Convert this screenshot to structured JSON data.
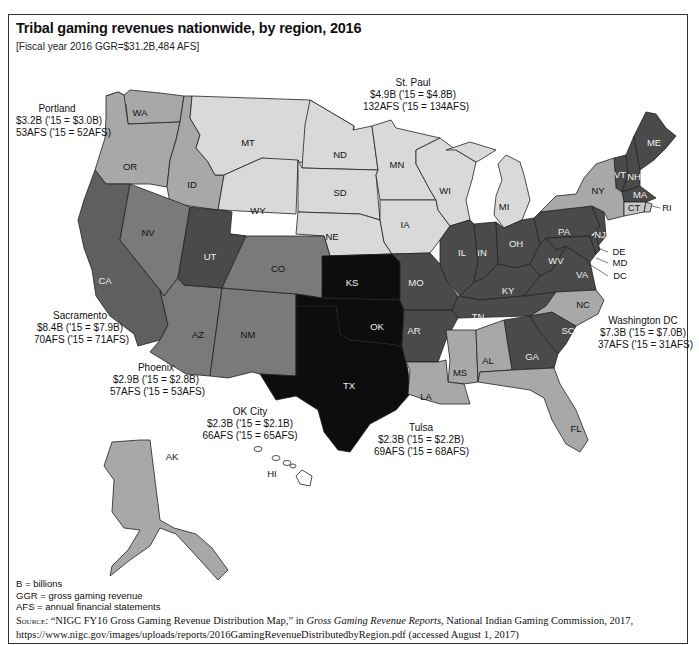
{
  "figure": {
    "title": "Tribal gaming revenues nationwide, by region, 2016",
    "subtitle": "[Fiscal year 2016 GGR=$31.2B,484 AFS]"
  },
  "colors": {
    "darkest": "#0d0d0d",
    "dark": "#4a4a4a",
    "medium_dark": "#5f5f5f",
    "medium": "#7a7a7a",
    "medium_light": "#a8a8a8",
    "light": "#d9d9d9",
    "border": "#222222"
  },
  "regions": {
    "portland": {
      "name": "Portland",
      "ggr": "$3.2B ('15 = $3.0B)",
      "afs": "53AFS ('15 = 52AFS)"
    },
    "st_paul": {
      "name": "St. Paul",
      "ggr": "$4.9B ('15 = $4.8B)",
      "afs": "132AFS ('15 = 134AFS)"
    },
    "sacramento": {
      "name": "Sacramento",
      "ggr": "$8.4B ('15 = $7.9B)",
      "afs": "70AFS ('15 = 71AFS)"
    },
    "phoenix": {
      "name": "Phoenix",
      "ggr": "$2.9B ('15 = $2.8B)",
      "afs": "57AFS ('15 = 53AFS)"
    },
    "ok_city": {
      "name": "OK City",
      "ggr": "$2.3B ('15 = $2.1B)",
      "afs": "66AFS ('15 = 65AFS)"
    },
    "tulsa": {
      "name": "Tulsa",
      "ggr": "$2.3B ('15 = $2.2B)",
      "afs": "69AFS ('15 = 68AFS)"
    },
    "washington_dc": {
      "name": "Washington DC",
      "ggr": "$7.3B ('15 = $7.0B)",
      "afs": "37AFS ('15 = 31AFS)"
    }
  },
  "states": {
    "WA": "WA",
    "OR": "OR",
    "ID": "ID",
    "MT": "MT",
    "WY": "WY",
    "ND": "ND",
    "SD": "SD",
    "NE": "NE",
    "MN": "MN",
    "IA": "IA",
    "WI": "WI",
    "MI": "MI",
    "CA": "CA",
    "NV": "NV",
    "UT": "UT",
    "CO": "CO",
    "AZ": "AZ",
    "NM": "NM",
    "KS": "KS",
    "OK": "OK",
    "TX": "TX",
    "MO": "MO",
    "AR": "AR",
    "LA": "LA",
    "MS": "MS",
    "AL": "AL",
    "FL": "FL",
    "GA": "GA",
    "SC": "SC",
    "NC": "NC",
    "TN": "TN",
    "KY": "KY",
    "IL": "IL",
    "IN": "IN",
    "OH": "OH",
    "WV": "WV",
    "VA": "VA",
    "PA": "PA",
    "NY": "NY",
    "NJ": "NJ",
    "DE": "DE",
    "MD": "MD",
    "DC": "DC",
    "VT": "VT",
    "NH": "NH",
    "ME": "ME",
    "MA": "MA",
    "CT": "CT",
    "RI": "RI",
    "AK": "AK",
    "HI": "HI"
  },
  "legend": [
    "B = billions",
    "GGR = gross gaming revenue",
    "AFS = annual financial statements"
  ],
  "source": {
    "label": "Source:",
    "quote": "“NIGC FY16 Gross Gaming Revenue Distribution Map,” in ",
    "publication": "Gross Gaming Revenue Reports",
    "rest": ", National Indian Gaming Commission, 2017,",
    "url_line": "https://www.nigc.gov/images/uploads/reports/2016GamingRevenueDistributedbyRegion.pdf (accessed August 1, 2017)"
  }
}
